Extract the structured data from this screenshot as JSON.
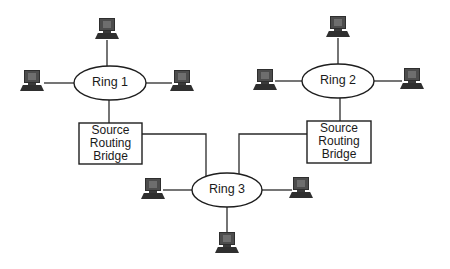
{
  "diagram": {
    "title": "",
    "rings": [
      {
        "id": "ring1",
        "label": "Ring 1"
      },
      {
        "id": "ring2",
        "label": "Ring 2"
      },
      {
        "id": "ring3",
        "label": "Ring 3"
      }
    ],
    "bridges": [
      {
        "id": "bridge1",
        "line1": "Source",
        "line2": "Routing",
        "line3": "Bridge",
        "connects": [
          "Ring 1",
          "Ring 3"
        ]
      },
      {
        "id": "bridge2",
        "line1": "Source",
        "line2": "Routing",
        "line3": "Bridge",
        "connects": [
          "Ring 2",
          "Ring 3"
        ]
      }
    ],
    "workstations": [
      {
        "ring": "Ring 1",
        "position": "top",
        "icon": "computer-icon"
      },
      {
        "ring": "Ring 1",
        "position": "left",
        "icon": "computer-icon"
      },
      {
        "ring": "Ring 1",
        "position": "right",
        "icon": "computer-icon"
      },
      {
        "ring": "Ring 2",
        "position": "top",
        "icon": "computer-icon"
      },
      {
        "ring": "Ring 2",
        "position": "left",
        "icon": "computer-icon"
      },
      {
        "ring": "Ring 2",
        "position": "right",
        "icon": "computer-icon"
      },
      {
        "ring": "Ring 3",
        "position": "left",
        "icon": "computer-icon"
      },
      {
        "ring": "Ring 3",
        "position": "right",
        "icon": "computer-icon"
      },
      {
        "ring": "Ring 3",
        "position": "bottom",
        "icon": "computer-icon"
      }
    ],
    "colors": {
      "line": "#2a2a2a",
      "computer": "#4d4d4d",
      "background": "#ffffff"
    }
  }
}
